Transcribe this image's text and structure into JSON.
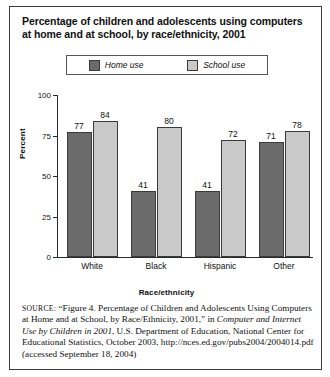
{
  "title": "Percentage of children and adolescents using computers at home and at school, by race/ethnicity, 2001",
  "legend": {
    "home": "Home use",
    "school": "School use",
    "home_color": "#6b6b6b",
    "school_color": "#c9c9c9"
  },
  "chart_data": {
    "type": "bar",
    "title": "Percentage of children and adolescents using computers at home and at school, by race/ethnicity, 2001",
    "xlabel": "Race/ethnicity",
    "ylabel": "Percent",
    "categories": [
      "White",
      "Black",
      "Hispanic",
      "Other"
    ],
    "series": [
      {
        "name": "Home use",
        "color": "#6b6b6b",
        "values": [
          77,
          41,
          41,
          71
        ]
      },
      {
        "name": "School use",
        "color": "#c9c9c9",
        "values": [
          84,
          80,
          72,
          78
        ]
      }
    ],
    "ylim": [
      0,
      100
    ],
    "yticks": [
      0,
      25,
      50,
      75,
      100
    ],
    "ytick_labels": [
      "0",
      "25",
      "50",
      "75",
      "100"
    ],
    "grid": false,
    "legend_position": "top-center",
    "data_labels": true
  },
  "source": {
    "prefix": "SOURCE:",
    "text_before_italic": " “Figure 4. Percentage of Children and Adolescents Using Computers at Home and at School, by Race/Ethnicity, 2001,” in ",
    "italic_title": "Computer and Internet Use by Children in 2001",
    "text_after_italic": ", U.S. Department of Education, National Center for Educational Statistics, October 2003, http://nces.ed.gov/pubs2004/2004014.pdf (accessed September 18, 2004)"
  }
}
